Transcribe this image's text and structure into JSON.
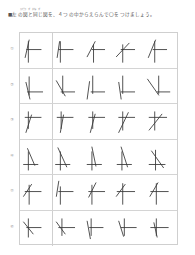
{
  "header": {
    "furigana": "ひだり　ず　おな　ず",
    "instruction": "■左の図と同じ図を、４つの中からえらんで〇をつけましょう。"
  },
  "rows": [
    {
      "label": "①",
      "figures": [
        {
          "v": [
            8,
            6,
            8,
            32
          ],
          "h": [
            6,
            16,
            24,
            16
          ],
          "s": [
            9,
            4,
            4,
            26
          ]
        },
        {
          "v": [
            8,
            6,
            8,
            32
          ],
          "h": [
            6,
            16,
            24,
            16
          ],
          "s": [
            7,
            6,
            4,
            26
          ]
        },
        {
          "v": [
            12,
            10,
            12,
            32
          ],
          "h": [
            10,
            16,
            26,
            16
          ],
          "s": [
            14,
            6,
            4,
            25
          ]
        },
        {
          "v": [
            11,
            10,
            11,
            32
          ],
          "h": [
            9,
            16,
            26,
            16
          ],
          "s": [
            19,
            8,
            3,
            25
          ]
        },
        {
          "v": [
            11,
            6,
            11,
            32
          ],
          "h": [
            9,
            16,
            26,
            16
          ],
          "s": [
            12,
            4,
            3,
            26
          ]
        }
      ]
    },
    {
      "label": "②",
      "figures": [
        {
          "v": [
            9,
            5,
            9,
            28
          ],
          "h": [
            7,
            24,
            26,
            24
          ],
          "s": [
            5,
            12,
            10,
            33
          ]
        },
        {
          "v": [
            11,
            4,
            11,
            26
          ],
          "h": [
            9,
            24,
            26,
            24
          ],
          "s": [
            3,
            10,
            14,
            29
          ]
        },
        {
          "v": [
            11,
            4,
            11,
            26
          ],
          "h": [
            9,
            24,
            26,
            24
          ],
          "s": [
            7,
            11,
            4,
            33
          ]
        },
        {
          "v": [
            11,
            4,
            11,
            26
          ],
          "h": [
            9,
            24,
            26,
            24
          ],
          "s": [
            6,
            12,
            9,
            33
          ]
        },
        {
          "v": [
            16,
            4,
            16,
            26
          ],
          "h": [
            14,
            24,
            30,
            24
          ],
          "s": [
            2,
            8,
            16,
            28
          ]
        }
      ]
    },
    {
      "label": "③",
      "figures": [
        {
          "v": [
            8,
            5,
            8,
            26
          ],
          "h": [
            4,
            12,
            24,
            12
          ],
          "s": [
            12,
            9,
            5,
            31
          ]
        },
        {
          "v": [
            9,
            5,
            9,
            26
          ],
          "h": [
            4,
            12,
            24,
            12
          ],
          "s": [
            12,
            9,
            8,
            31
          ]
        },
        {
          "v": [
            11,
            5,
            11,
            26
          ],
          "h": [
            6,
            12,
            26,
            12
          ],
          "s": [
            14,
            8,
            8,
            31
          ]
        },
        {
          "v": [
            11,
            5,
            11,
            28
          ],
          "h": [
            6,
            12,
            26,
            12
          ],
          "s": [
            18,
            6,
            6,
            31
          ]
        },
        {
          "v": [
            11,
            5,
            11,
            28
          ],
          "h": [
            4,
            12,
            26,
            12
          ],
          "s": [
            20,
            8,
            4,
            28
          ]
        }
      ]
    },
    {
      "label": "④",
      "figures": [
        {
          "v": [
            8,
            10,
            8,
            33
          ],
          "h": [
            2,
            26,
            20,
            26
          ],
          "s": [
            7,
            6,
            16,
            27
          ]
        },
        {
          "v": [
            8,
            10,
            8,
            33
          ],
          "h": [
            2,
            26,
            20,
            26
          ],
          "s": [
            5,
            5,
            16,
            29
          ]
        },
        {
          "v": [
            10,
            10,
            10,
            33
          ],
          "h": [
            4,
            26,
            22,
            26
          ],
          "s": [
            10,
            4,
            15,
            28
          ]
        },
        {
          "v": [
            10,
            10,
            10,
            33
          ],
          "h": [
            4,
            26,
            22,
            26
          ],
          "s": [
            9,
            4,
            17,
            29
          ]
        },
        {
          "v": [
            12,
            8,
            12,
            33
          ],
          "h": [
            4,
            26,
            24,
            26
          ],
          "s": [
            7,
            9,
            22,
            30
          ]
        }
      ]
    },
    {
      "label": "⑤",
      "figures": [
        {
          "v": [
            9,
            8,
            9,
            32
          ],
          "h": [
            4,
            16,
            24,
            16
          ],
          "s": [
            12,
            7,
            2,
            22
          ]
        },
        {
          "v": [
            8,
            10,
            8,
            32
          ],
          "h": [
            6,
            16,
            24,
            16
          ],
          "s": [
            6,
            3,
            3,
            22
          ]
        },
        {
          "v": [
            10,
            8,
            10,
            32
          ],
          "h": [
            6,
            16,
            26,
            16
          ],
          "s": [
            15,
            5,
            6,
            23
          ]
        },
        {
          "v": [
            11,
            6,
            11,
            32
          ],
          "h": [
            4,
            16,
            26,
            16
          ],
          "s": [
            14,
            7,
            3,
            22
          ]
        },
        {
          "v": [
            13,
            6,
            13,
            32
          ],
          "h": [
            6,
            16,
            28,
            16
          ],
          "s": [
            15,
            5,
            5,
            22
          ]
        }
      ]
    },
    {
      "label": "⑥",
      "figures": [
        {
          "v": [
            8,
            5,
            8,
            28
          ],
          "h": [
            6,
            16,
            24,
            16
          ],
          "s": [
            2,
            9,
            14,
            24
          ]
        },
        {
          "v": [
            10,
            5,
            10,
            26
          ],
          "h": [
            6,
            16,
            26,
            16
          ],
          "s": [
            3,
            9,
            14,
            24
          ]
        },
        {
          "v": [
            9,
            5,
            9,
            26
          ],
          "h": [
            7,
            16,
            24,
            16
          ],
          "s": [
            4,
            8,
            8,
            30
          ]
        },
        {
          "v": [
            13,
            5,
            13,
            26
          ],
          "h": [
            9,
            16,
            28,
            16
          ],
          "s": [
            6,
            8,
            12,
            27
          ]
        },
        {
          "v": [
            13,
            5,
            13,
            26
          ],
          "h": [
            6,
            16,
            28,
            16
          ],
          "s": [
            10,
            10,
            14,
            28
          ]
        }
      ]
    }
  ]
}
